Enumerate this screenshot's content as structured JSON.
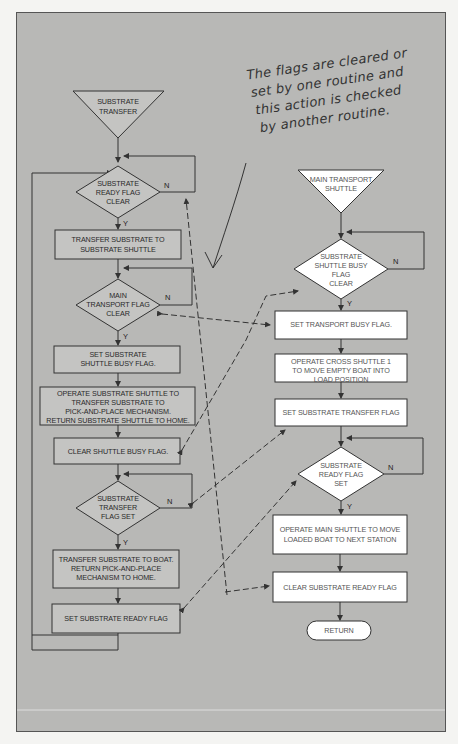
{
  "annotation": {
    "lines": [
      "The flags are cleared or",
      "set by one routine and",
      "this action is checked",
      "by another routine."
    ]
  },
  "left_flow": {
    "start": {
      "line1": "SUBSTRATE",
      "line2": "TRANSFER"
    },
    "decision1": {
      "line1": "SUBSTRATE",
      "line2": "READY FLAG",
      "line3": "CLEAR",
      "yes": "Y",
      "no": "N"
    },
    "step1": {
      "line1": "TRANSFER SUBSTRATE TO",
      "line2": "SUBSTRATE SHUTTLE"
    },
    "decision2": {
      "line1": "MAIN",
      "line2": "TRANSPORT FLAG",
      "line3": "CLEAR",
      "yes": "Y",
      "no": "N"
    },
    "step2": {
      "line1": "SET SUBSTRATE",
      "line2": "SHUTTLE BUSY FLAG."
    },
    "step3": {
      "line1": "OPERATE SUBSTRATE SHUTTLE TO",
      "line2": "TRANSFER SUBSTRATE TO",
      "line3": "PICK-AND-PLACE MECHANISM.",
      "line4": "RETURN SUBSTRATE SHUTTLE TO HOME."
    },
    "step4": {
      "line1": "CLEAR SHUTTLE BUSY FLAG."
    },
    "decision3": {
      "line1": "SUBSTRATE",
      "line2": "TRANSFER",
      "line3": "FLAG SET",
      "yes": "Y",
      "no": "N"
    },
    "step5": {
      "line1": "TRANSFER SUBSTRATE TO BOAT.",
      "line2": "RETURN PICK-AND-PLACE",
      "line3": "MECHANISM TO HOME."
    },
    "step6": {
      "line1": "SET SUBSTRATE READY FLAG"
    }
  },
  "right_flow": {
    "start": {
      "line1": "MAIN TRANSPORT",
      "line2": "SHUTTLE"
    },
    "decision1": {
      "line1": "SUBSTRATE",
      "line2": "SHUTTLE BUSY",
      "line3": "FLAG",
      "line4": "CLEAR",
      "yes": "Y",
      "no": "N"
    },
    "step1": {
      "line1": "SET TRANSPORT BUSY FLAG."
    },
    "step2": {
      "line1": "OPERATE CROSS SHUTTLE 1",
      "line2": "TO MOVE EMPTY BOAT INTO",
      "line3": "LOAD POSITION"
    },
    "step3": {
      "line1": "SET SUBSTRATE TRANSFER FLAG"
    },
    "decision2": {
      "line1": "SUBSTRATE",
      "line2": "READY FLAG",
      "line3": "SET",
      "yes": "Y",
      "no": "N"
    },
    "step4": {
      "line1": "OPERATE MAIN SHUTTLE TO MOVE",
      "line2": "LOADED BOAT TO NEXT STATION"
    },
    "step5": {
      "line1": "CLEAR SUBSTRATE READY FLAG"
    },
    "end": {
      "label": "RETURN"
    }
  },
  "colors": {
    "panel": "#b8b8b6",
    "gray_shape": "#c4c4c2",
    "white_shape": "#ffffff",
    "stroke": "#333333"
  }
}
